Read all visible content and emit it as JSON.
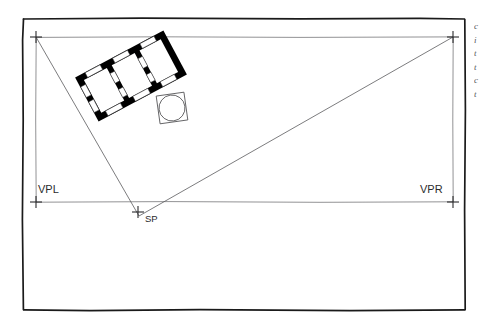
{
  "drawing": {
    "title": "Two-point perspective setup: plan, station point and vanishing points",
    "background_color": "#ffffff",
    "ink_color": "#2b2b2d",
    "construction_line_color": "#6d6d70",
    "poche_fill": "#000000",
    "frame": {
      "name": "sheet-border",
      "style": "hand-drawn rectangle",
      "stroke_color": "#1a1a1a",
      "stroke_width": 1.6,
      "left": 22,
      "top": 18,
      "right": 465,
      "bottom": 310
    },
    "labels": {
      "vpl": "VPL",
      "vpr": "VPR",
      "sp": "SP"
    },
    "points": [
      {
        "name": "vpl-top-cross",
        "label": "",
        "x": 36,
        "y": 37
      },
      {
        "name": "vpr-top-cross",
        "label": "",
        "x": 453,
        "y": 37
      },
      {
        "name": "vpl-cross",
        "label": "VPL",
        "x": 36,
        "y": 202
      },
      {
        "name": "vpr-cross",
        "label": "VPR",
        "x": 453,
        "y": 202
      },
      {
        "name": "sp-cross",
        "label": "SP",
        "x": 138,
        "y": 212
      }
    ],
    "lines": [
      {
        "name": "picture-plane-line",
        "x1": 36,
        "y1": 37,
        "x2": 453,
        "y2": 37
      },
      {
        "name": "horizon-line",
        "x1": 36,
        "y1": 202,
        "x2": 453,
        "y2": 202
      },
      {
        "name": "vpl-vertical",
        "x1": 36,
        "y1": 37,
        "x2": 36,
        "y2": 202
      },
      {
        "name": "vpr-vertical",
        "x1": 453,
        "y1": 37,
        "x2": 453,
        "y2": 202
      },
      {
        "name": "sight-line-left",
        "x1": 36,
        "y1": 37,
        "x2": 138,
        "y2": 215
      },
      {
        "name": "sight-line-right",
        "x1": 453,
        "y1": 37,
        "x2": 138,
        "y2": 215
      }
    ],
    "plan": {
      "name": "rotated-floor-plan",
      "rotation_deg": -28,
      "center_x": 131,
      "center_y": 76,
      "rooms": 3,
      "wall_fill": "#000000",
      "opening_fill": "#ffffff"
    },
    "circle_object": {
      "name": "circle-in-square-object",
      "center_x": 172,
      "center_y": 108,
      "radius": 13,
      "square_size": 28,
      "rotation_deg": -8
    },
    "margin_notes": {
      "name": "clipped-margin-text",
      "clipped": true,
      "lines": [
        "c",
        "i",
        "t",
        "t",
        "c",
        "t"
      ]
    }
  }
}
